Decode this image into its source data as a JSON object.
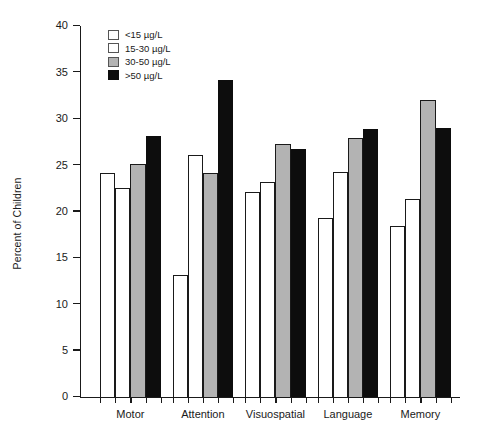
{
  "chart_data": {
    "type": "bar",
    "title": "",
    "subtitle": "",
    "xlabel": "",
    "ylabel": "Percent of Children",
    "ylim": [
      0,
      40
    ],
    "ytick_step": 5,
    "yticks": [
      "40",
      "35",
      "30",
      "25",
      "20",
      "15",
      "10",
      "5",
      "0"
    ],
    "grid": false,
    "legend_position": "top-left-inside",
    "categories": [
      "Motor",
      "Attention",
      "Visuospatial",
      "Language",
      "Memory"
    ],
    "series": [
      {
        "name": "<15 µg/L",
        "fill": "white",
        "color": "#ffffff",
        "values": [
          24.1,
          13.2,
          22.1,
          19.3,
          18.4
        ]
      },
      {
        "name": "15-30 µg/L",
        "fill": "white",
        "color": "#ffffff",
        "values": [
          22.5,
          26.1,
          23.2,
          24.3,
          21.4
        ]
      },
      {
        "name": "30-50 µg/L",
        "fill": "gray",
        "color": "#b3b3b3",
        "values": [
          25.1,
          24.2,
          27.3,
          27.9,
          32.0
        ]
      },
      {
        "name": ">50 µg/L",
        "fill": "black",
        "color": "#0d0d0d",
        "values": [
          28.1,
          34.2,
          26.7,
          28.9,
          29.0
        ]
      }
    ]
  }
}
